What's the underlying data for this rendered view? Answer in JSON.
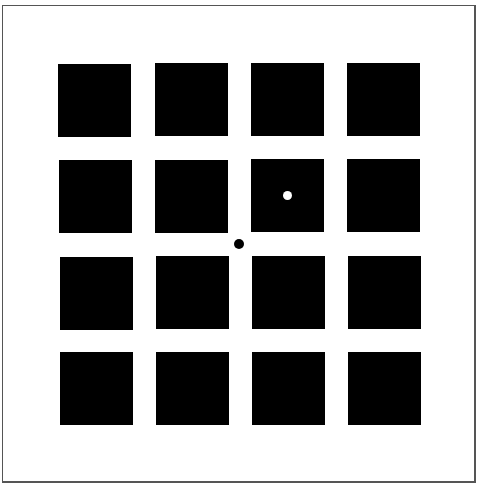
{
  "figure": {
    "rows": 4,
    "cols": 4,
    "square_color": "#000000",
    "background_color": "#ffffff",
    "squares": [
      {
        "row": 0,
        "col": 0,
        "x": 58,
        "y": 64
      },
      {
        "row": 0,
        "col": 1,
        "x": 155,
        "y": 63
      },
      {
        "row": 0,
        "col": 2,
        "x": 251,
        "y": 63
      },
      {
        "row": 0,
        "col": 3,
        "x": 347,
        "y": 63
      },
      {
        "row": 1,
        "col": 0,
        "x": 59,
        "y": 160
      },
      {
        "row": 1,
        "col": 1,
        "x": 155,
        "y": 160
      },
      {
        "row": 1,
        "col": 2,
        "x": 251,
        "y": 159
      },
      {
        "row": 1,
        "col": 3,
        "x": 347,
        "y": 159
      },
      {
        "row": 2,
        "col": 0,
        "x": 60,
        "y": 257
      },
      {
        "row": 2,
        "col": 1,
        "x": 156,
        "y": 256
      },
      {
        "row": 2,
        "col": 2,
        "x": 252,
        "y": 256
      },
      {
        "row": 2,
        "col": 3,
        "x": 348,
        "y": 256
      },
      {
        "row": 3,
        "col": 0,
        "x": 60,
        "y": 352
      },
      {
        "row": 3,
        "col": 1,
        "x": 156,
        "y": 352
      },
      {
        "row": 3,
        "col": 2,
        "x": 252,
        "y": 352
      },
      {
        "row": 3,
        "col": 3,
        "x": 348,
        "y": 352
      }
    ],
    "dots": [
      {
        "name": "white-dot",
        "color": "#ffffff",
        "cx": 287,
        "cy": 195
      },
      {
        "name": "black-fixation-dot",
        "color": "#000000",
        "cx": 239,
        "cy": 244
      }
    ]
  }
}
